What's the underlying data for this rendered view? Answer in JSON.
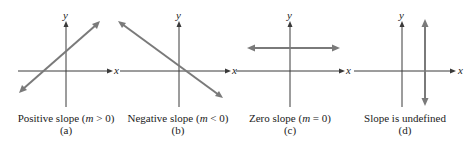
{
  "figure": {
    "colors": {
      "axis": "#3a3a3a",
      "line": "#7a7a7a",
      "text": "#222222",
      "background": "#ffffff"
    },
    "panels": [
      {
        "id": "a",
        "axis_x_label": "x",
        "axis_y_label": "y",
        "caption_prefix": "Positive slope (",
        "caption_var": "m",
        "caption_suffix": " > 0)",
        "sublabel": "(a)",
        "line_type": "positive-slope"
      },
      {
        "id": "b",
        "axis_x_label": "x",
        "axis_y_label": "y",
        "caption_prefix": "Negative slope (",
        "caption_var": "m",
        "caption_suffix": " < 0)",
        "sublabel": "(b)",
        "line_type": "negative-slope"
      },
      {
        "id": "c",
        "axis_x_label": "x",
        "axis_y_label": "y",
        "caption_prefix": "Zero slope (",
        "caption_var": "m",
        "caption_suffix": " = 0)",
        "sublabel": "(c)",
        "line_type": "horizontal"
      },
      {
        "id": "d",
        "axis_x_label": "x",
        "axis_y_label": "y",
        "caption_prefix": "Slope is undefined",
        "caption_var": "",
        "caption_suffix": "",
        "sublabel": "(d)",
        "line_type": "vertical"
      }
    ]
  }
}
